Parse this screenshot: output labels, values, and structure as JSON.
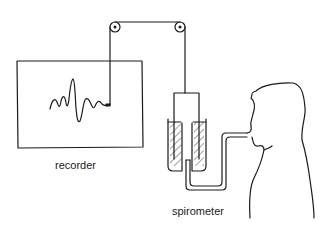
{
  "diagram": {
    "type": "spirometer recording apparatus",
    "labels": {
      "recorder": "recorder",
      "spirometer": "spirometer"
    },
    "components": [
      "recorder",
      "pulley-left",
      "pulley-right",
      "string",
      "spirometer-bell",
      "water-chamber",
      "breathing-tube",
      "subject"
    ],
    "colors": {
      "line": "#1a1a1a",
      "background": "#ffffff"
    }
  }
}
